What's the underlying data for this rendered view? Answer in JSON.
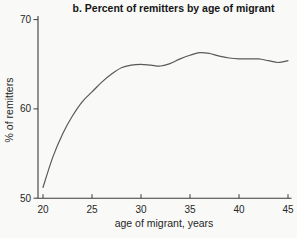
{
  "chart_data": {
    "type": "line",
    "title": "b. Percent of remitters by age of migrant",
    "xlabel": "age of migrant, years",
    "ylabel": "% of remitters",
    "x": [
      20,
      21,
      22,
      23,
      24,
      25,
      26,
      27,
      28,
      29,
      30,
      31,
      32,
      33,
      34,
      35,
      36,
      37,
      38,
      39,
      40,
      41,
      42,
      43,
      44,
      45
    ],
    "y": [
      51.2,
      54.6,
      57.2,
      59.2,
      60.8,
      61.9,
      63.0,
      63.9,
      64.6,
      64.9,
      65.0,
      64.9,
      64.8,
      65.1,
      65.6,
      66.0,
      66.3,
      66.2,
      65.9,
      65.7,
      65.6,
      65.6,
      65.6,
      65.4,
      65.2,
      65.4
    ],
    "xlim": [
      20,
      45
    ],
    "ylim": [
      50,
      70
    ],
    "x_ticks": [
      20,
      25,
      30,
      35,
      40,
      45
    ],
    "y_ticks": [
      50,
      60,
      70
    ],
    "grid": false,
    "legend": "none",
    "colors": {
      "line": "#595959",
      "axis": "#3c3c3c",
      "tick_text": "#262626",
      "title_text": "#161616",
      "background": "#f9f9f7"
    }
  }
}
